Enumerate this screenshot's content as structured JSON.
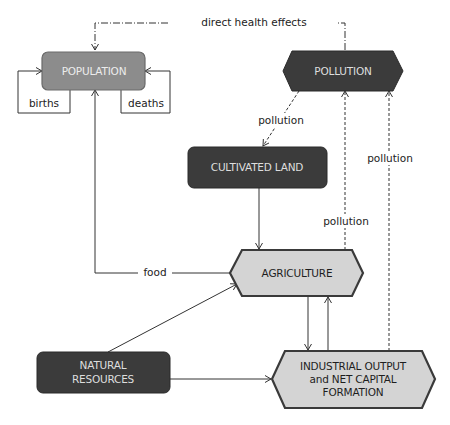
{
  "diagram": {
    "colors": {
      "dark_node": "#3b3b3b",
      "medium_node": "#8c8c8c",
      "light_node": "#d4d4d4",
      "node_border": "#3a3a3a",
      "line": "#333333",
      "dark_text": "#e6e6e6",
      "light_text": "#1e1e1e"
    },
    "nodes": {
      "population": {
        "label": "POPULATION",
        "shape": "rounded-rect",
        "fill": "medium"
      },
      "pollution": {
        "label": "POLLUTION",
        "shape": "hexagon",
        "fill": "dark"
      },
      "cultivated_land": {
        "label": "CULTIVATED LAND",
        "shape": "rounded-rect",
        "fill": "dark"
      },
      "agriculture": {
        "label": "AGRICULTURE",
        "shape": "hexagon",
        "fill": "light"
      },
      "natural_resources": {
        "label_line1": "NATURAL",
        "label_line2": "RESOURCES",
        "shape": "rounded-rect",
        "fill": "dark"
      },
      "industrial_output": {
        "label_line1": "INDUSTRIAL OUTPUT",
        "label_line2": "and NET CAPITAL",
        "label_line3": "FORMATION",
        "shape": "hexagon",
        "fill": "light"
      }
    },
    "edges": {
      "direct_health_effects": {
        "label": "direct health effects",
        "from": "pollution",
        "to": "population",
        "style": "dash-dot"
      },
      "births": {
        "label": "births",
        "from": "population",
        "to": "population",
        "style": "solid"
      },
      "deaths": {
        "label": "deaths",
        "from": "population",
        "to": "population",
        "style": "solid"
      },
      "pollution_to_land": {
        "label": "pollution",
        "from": "pollution",
        "to": "cultivated_land",
        "style": "dashed"
      },
      "land_to_agriculture": {
        "from": "cultivated_land",
        "to": "agriculture",
        "style": "solid"
      },
      "food": {
        "label": "food",
        "from": "agriculture",
        "to": "population",
        "style": "solid"
      },
      "agriculture_pollution": {
        "label": "pollution",
        "from": "agriculture",
        "to": "pollution",
        "style": "dashed"
      },
      "industry_pollution": {
        "label": "pollution",
        "from": "industrial_output",
        "to": "pollution",
        "style": "dashed"
      },
      "resources_to_agriculture": {
        "from": "natural_resources",
        "to": "agriculture",
        "style": "solid"
      },
      "resources_to_industry": {
        "from": "natural_resources",
        "to": "industrial_output",
        "style": "solid"
      },
      "agriculture_to_industry": {
        "from": "agriculture",
        "to": "industrial_output",
        "style": "solid"
      },
      "industry_to_agriculture": {
        "from": "industrial_output",
        "to": "agriculture",
        "style": "solid"
      }
    }
  }
}
